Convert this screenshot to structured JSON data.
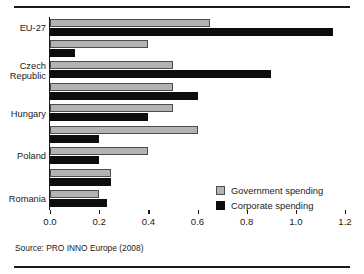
{
  "chart_data": {
    "type": "bar",
    "orientation": "horizontal",
    "title": "",
    "xlabel": "",
    "ylabel": "",
    "xlim": [
      0.0,
      1.2
    ],
    "grid": false,
    "xticks": [
      "0.0",
      "0.2",
      "0.4",
      "0.6",
      "0.8",
      "1.0",
      "1.2"
    ],
    "xtick_values": [
      0.0,
      0.2,
      0.4,
      0.6,
      0.8,
      1.0,
      1.2
    ],
    "categories": [
      "EU-27",
      "",
      "Czech\nRepublic",
      "",
      "Hungary",
      "",
      "Poland",
      "",
      "Romania"
    ],
    "series": [
      {
        "name": "Government spending",
        "color": "#b3b3b3",
        "values": [
          0.65,
          0.4,
          0.5,
          0.5,
          0.5,
          0.6,
          0.4,
          0.25,
          0.2
        ]
      },
      {
        "name": "Corporate spending",
        "color": "#0d0d0d",
        "values": [
          1.15,
          0.1,
          0.9,
          0.6,
          0.4,
          0.2,
          0.2,
          0.25,
          0.23
        ]
      }
    ],
    "legend": {
      "position": "bottom-right",
      "entries": [
        {
          "label": "Government spending",
          "swatch": "gov"
        },
        {
          "label": "Corporate spending",
          "swatch": "corp"
        }
      ]
    }
  },
  "source": {
    "text": "Source: PRO INNO Europe (2008)"
  }
}
